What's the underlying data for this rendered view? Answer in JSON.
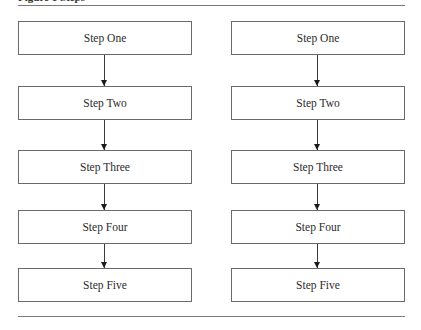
{
  "figure": {
    "caption_clipped": "Figure 1   Steps",
    "columns": [
      {
        "steps": [
          {
            "label": "Step One"
          },
          {
            "label": "Step Two"
          },
          {
            "label": "Step Three"
          },
          {
            "label": "Step Four"
          },
          {
            "label": "Step Five"
          }
        ]
      },
      {
        "steps": [
          {
            "label": "Step One"
          },
          {
            "label": "Step Two"
          },
          {
            "label": "Step Three"
          },
          {
            "label": "Step Four"
          },
          {
            "label": "Step Five"
          }
        ]
      }
    ],
    "colors": {
      "box_border": "#6a6a6a",
      "arrow": "#3a3a3a",
      "rule": "#7a7a7a",
      "text": "#2b2b2b"
    }
  }
}
